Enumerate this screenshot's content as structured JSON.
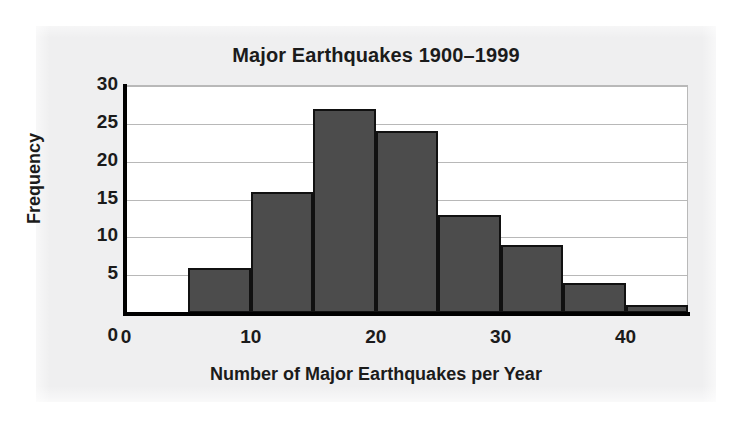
{
  "chart_data": {
    "type": "bar",
    "title": "Major Earthquakes 1900–1999",
    "xlabel": "Number of Major Earthquakes per Year",
    "ylabel": "Frequency",
    "categories": [
      "5–10",
      "10–15",
      "15–20",
      "20–25",
      "25–30",
      "30–35",
      "35–40",
      "40–45"
    ],
    "bin_edges": [
      5,
      10,
      15,
      20,
      25,
      30,
      35,
      40,
      45
    ],
    "bin_width": 5,
    "values": [
      6,
      16,
      27,
      24,
      13,
      9,
      4,
      1
    ],
    "xlim": [
      0,
      45
    ],
    "ylim": [
      0,
      30
    ],
    "x_ticks": [
      "0",
      "10",
      "20",
      "30",
      "40"
    ],
    "x_tick_values": [
      0,
      10,
      20,
      30,
      40
    ],
    "y_ticks": [
      "0",
      "5",
      "10",
      "15",
      "20",
      "25",
      "30"
    ],
    "y_tick_values": [
      0,
      5,
      10,
      15,
      20,
      25,
      30
    ],
    "grid": "horizontal",
    "legend": null,
    "bar_color": "#4c4c4c",
    "bar_edge_color": "#111111",
    "axis_color": "#000000",
    "gridline_color": "#b8b8b8",
    "plot_background": "#ffffff",
    "panel_background": "#efeff0",
    "text_color": "#1b1b1b"
  }
}
